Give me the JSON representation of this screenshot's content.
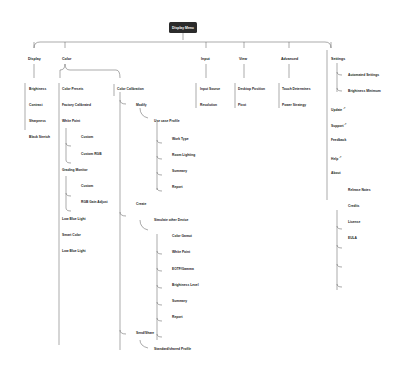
{
  "root": {
    "label": "Display Menu"
  },
  "branches": {
    "display": {
      "label": "Display",
      "items": [
        "Brightness",
        "Contrast",
        "Sharpness",
        "Black Stretch"
      ]
    },
    "color": {
      "label": "Color",
      "presets": {
        "label": "Color Presets",
        "items": [
          "Factory Calibrated",
          "White Point",
          "Grading Monitor",
          "Low Blue Light",
          "Smart Color",
          "Low Blue Light"
        ],
        "white_point_children": [
          "Custom",
          "Custom RGB"
        ],
        "grading_children": [
          "Custom",
          "RGB Gain Adjust"
        ]
      },
      "calibration": {
        "label": "Color Calibration",
        "modify": {
          "label": "Modify",
          "profile": "Use case Profile",
          "children": [
            "Work Type",
            "Room Lighting",
            "Summary",
            "Report"
          ]
        },
        "create": {
          "label": "Create",
          "device": "Simulate other Device",
          "children": [
            "Color Gamut",
            "White Point",
            "EOTF/Gamma",
            "Brightness Level",
            "Summary",
            "Report"
          ]
        },
        "share": {
          "label": "Send/Share",
          "profile": "Standard/shared Profile"
        }
      }
    },
    "input": {
      "label": "Input",
      "items": [
        "Input Source",
        "Resolution"
      ]
    },
    "view": {
      "label": "View",
      "items": [
        "Desktop Position",
        "Pivot"
      ]
    },
    "advanced": {
      "label": "Advanced",
      "items": [
        "Touch Determines",
        "Power Strategy"
      ]
    },
    "settings": {
      "label": "Settings",
      "children": [
        "Automated Settings",
        "Brightness Minimum"
      ],
      "items": [
        "Update",
        "Support",
        "Feedback",
        "Help"
      ],
      "external_marker": "↗",
      "about": {
        "label": "About",
        "children": [
          "Release Notes",
          "Credits",
          "License",
          "EULA"
        ]
      }
    }
  }
}
